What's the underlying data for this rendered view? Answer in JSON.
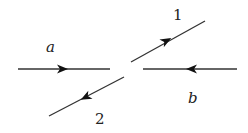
{
  "diagram": {
    "type": "feynman-like scattering diagram",
    "line_color": "#333333",
    "lines": [
      {
        "id": "a",
        "label": "a",
        "x1": 18,
        "y1": 69,
        "x2": 110,
        "y2": 69,
        "arrow": "right",
        "ax": 62,
        "ay": 69
      },
      {
        "id": "b",
        "label": "b",
        "x1": 143,
        "y1": 69,
        "x2": 237,
        "y2": 69,
        "arrow": "left",
        "ax": 192,
        "ay": 69
      },
      {
        "id": "1",
        "label": "1",
        "x1": 131,
        "y1": 62,
        "x2": 205,
        "y2": 21,
        "arrow": "up-right",
        "ax": 166,
        "ay": 41
      },
      {
        "id": "2",
        "label": "2",
        "x1": 124,
        "y1": 77,
        "x2": 49,
        "y2": 116,
        "arrow": "down-left",
        "ax": 86,
        "ay": 97
      }
    ],
    "labels": {
      "a": "a",
      "b": "b",
      "one": "1",
      "two": "2"
    }
  }
}
